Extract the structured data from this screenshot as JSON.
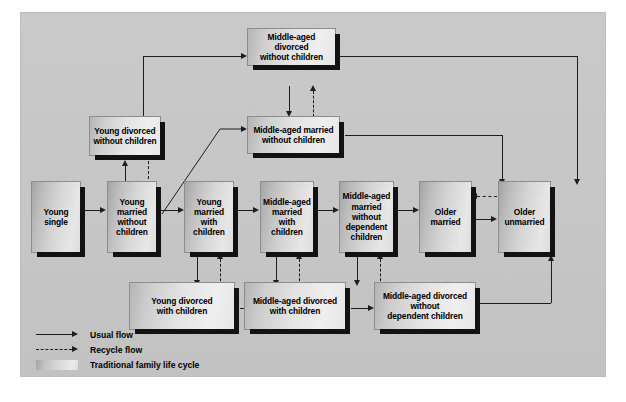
{
  "diagram": {
    "title": "Family life cycle",
    "background_color": "#c6c6c6",
    "box_fill_color": "#e3e3e3",
    "shadow_color": "#121212",
    "line_color": "#1d1d1d"
  },
  "nodes": {
    "young_single": {
      "label": "Young\nsingle",
      "traditional": true
    },
    "young_married_without_children": {
      "label": "Young\nmarried\nwithout\nchildren",
      "traditional": true
    },
    "young_married_with_children": {
      "label": "Young\nmarried\nwith\nchildren",
      "traditional": true
    },
    "middle_aged_married_with_children": {
      "label": "Middle-aged\nmarried\nwith\nchildren",
      "traditional": true
    },
    "middle_aged_married_without_dependent_children": {
      "label": "Middle-aged\nmarried without\ndependent\nchildren",
      "traditional": true
    },
    "older_married": {
      "label": "Older\nmarried",
      "traditional": true
    },
    "older_unmarried": {
      "label": "Older\nunmarried",
      "traditional": true
    },
    "young_divorced_without_children": {
      "label": "Young divorced\nwithout children",
      "traditional": false
    },
    "middle_aged_divorced_without_children": {
      "label": "Middle-aged divorced\nwithout children",
      "traditional": false
    },
    "middle_aged_married_without_children": {
      "label": "Middle-aged married\nwithout children",
      "traditional": false
    },
    "young_divorced_with_children": {
      "label": "Young divorced\nwith children",
      "traditional": false
    },
    "middle_aged_divorced_with_children": {
      "label": "Middle-aged divorced\nwith children",
      "traditional": false
    },
    "middle_aged_divorced_without_dependent_children": {
      "label": "Middle-aged divorced\nwithout\ndependent children",
      "traditional": false
    }
  },
  "legend": {
    "items": [
      {
        "key": "usual-flow",
        "label": "Usual flow",
        "style": "solid-arrow"
      },
      {
        "key": "recycle-flow",
        "label": "Recycle flow",
        "style": "dashed-arrow"
      },
      {
        "key": "traditional-family-life-cycle",
        "label": "Traditional family life cycle",
        "style": "swatch"
      }
    ]
  },
  "flows": {
    "usual": [
      "young single -> young married without children",
      "young married without children -> young married with children",
      "young married without children -> middle-aged married without children",
      "young married with children -> middle-aged married with children",
      "young married with children -> young divorced with children",
      "middle-aged married with children -> middle-aged married without dependent children",
      "middle-aged married with children -> middle-aged divorced with children",
      "middle-aged married without dependent children -> older married",
      "middle-aged married without dependent children -> middle-aged divorced without dependent children",
      "older married -> older unmarried",
      "young married without children -> young divorced without children",
      "young divorced without children -> middle-aged divorced without children",
      "middle-aged divorced without children -> middle-aged married without children",
      "middle-aged divorced without children -> older unmarried",
      "middle-aged married without children -> older married",
      "young divorced with children -> middle-aged divorced with children",
      "middle-aged divorced with children -> middle-aged divorced without dependent children",
      "middle-aged divorced without dependent children -> older unmarried"
    ],
    "recycle": [
      "young divorced without children -> young married without children",
      "middle-aged married without children -> middle-aged divorced without children",
      "young divorced with children -> young married with children",
      "middle-aged divorced with children -> middle-aged married with children",
      "middle-aged divorced without dependent children -> middle-aged married without dependent children",
      "older unmarried -> older married"
    ]
  }
}
